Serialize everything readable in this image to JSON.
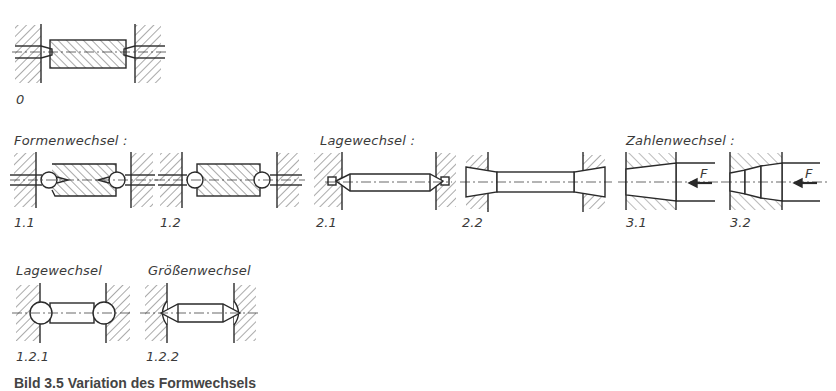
{
  "figure": {
    "caption": "Bild 3.5 Variation des Formwechsels",
    "groups": {
      "formenwechsel": "Formenwechsel :",
      "lagewechsel": "Lagewechsel :",
      "zahlenwechsel": "Zahlenwechsel :",
      "lagewechsel_sub": "Lagewechsel",
      "groessenwechsel_sub": "Größenwechsel"
    },
    "variants": [
      {
        "id": "0",
        "label": "0",
        "description": "Ausgangsform: Werkstück zwischen Zentrierspitzen"
      },
      {
        "id": "1.1",
        "label": "1.1",
        "group": "Formenwechsel"
      },
      {
        "id": "1.2",
        "label": "1.2",
        "group": "Formenwechsel"
      },
      {
        "id": "1.2.1",
        "label": "1.2.1",
        "group": "Lagewechsel"
      },
      {
        "id": "1.2.2",
        "label": "1.2.2",
        "group": "Größenwechsel"
      },
      {
        "id": "2.1",
        "label": "2.1",
        "group": "Lagewechsel"
      },
      {
        "id": "2.2",
        "label": "2.2",
        "group": "Lagewechsel"
      },
      {
        "id": "3.1",
        "label": "3.1",
        "group": "Zahlenwechsel",
        "force_label": "F"
      },
      {
        "id": "3.2",
        "label": "3.2",
        "group": "Zahlenwechsel",
        "force_label": "F"
      }
    ],
    "colors": {
      "line": "#2a2a2a",
      "hatch": "#555555",
      "background": "#ffffff"
    }
  }
}
